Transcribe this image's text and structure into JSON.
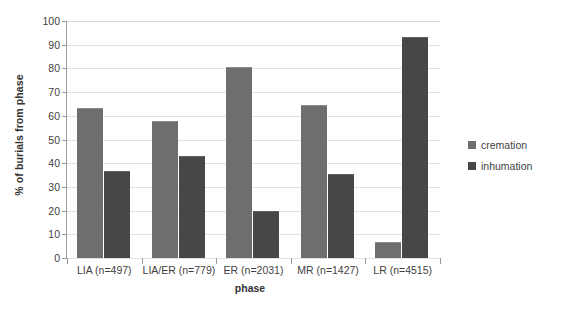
{
  "chart_data": {
    "type": "bar",
    "title": "",
    "xlabel": "phase",
    "ylabel": "% of burials from phase",
    "ylim": [
      0,
      100
    ],
    "ytick_step": 10,
    "yticks": [
      0,
      10,
      20,
      30,
      40,
      50,
      60,
      70,
      80,
      90,
      100
    ],
    "grid": true,
    "legend_position": "right",
    "categories": [
      "LIA (n=497)",
      "LIA/ER (n=779)",
      "ER (n=2031)",
      "MR (n=1427)",
      "LR (n=4515)"
    ],
    "series": [
      {
        "name": "cremation",
        "color": "#6e6e6e",
        "values": [
          63,
          57.5,
          80,
          64,
          6.5
        ]
      },
      {
        "name": "inhumation",
        "color": "#474747",
        "values": [
          36.5,
          42.5,
          19.5,
          35,
          93
        ]
      }
    ]
  },
  "legend": {
    "items": [
      {
        "label": "cremation",
        "swatch": "cremation-swatch"
      },
      {
        "label": "inhumation",
        "swatch": "inhumation-swatch"
      }
    ]
  }
}
